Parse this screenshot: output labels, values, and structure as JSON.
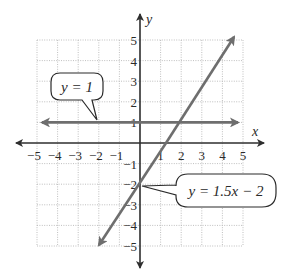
{
  "chart_data": {
    "type": "line",
    "title": "",
    "xlabel": "x",
    "ylabel": "y",
    "xlim": [
      -5,
      5
    ],
    "ylim": [
      -5,
      5
    ],
    "grid": true,
    "x_ticks": [
      -5,
      -4,
      -3,
      -2,
      -1,
      1,
      2,
      3,
      4,
      5
    ],
    "y_ticks": [
      -5,
      -4,
      -3,
      -2,
      -1,
      1,
      2,
      3,
      4,
      5
    ],
    "x_tick_labels": [
      "−5",
      "−4",
      "−3",
      "−2",
      "−1",
      "1",
      "2",
      "3",
      "4",
      "5"
    ],
    "y_tick_labels": [
      "−5",
      "−4",
      "−3",
      "−2",
      "−1",
      "1",
      "2",
      "3",
      "4",
      "5"
    ],
    "series": [
      {
        "name": "y = 1",
        "equation": "y = 1",
        "x": [
          -5,
          5
        ],
        "y": [
          1,
          1
        ],
        "color": "#6e6e6e",
        "arrows": "both"
      },
      {
        "name": "y = 1.5x − 2",
        "equation": "y = 1.5x - 2",
        "x": [
          -2,
          4.67
        ],
        "y": [
          -5,
          5
        ],
        "color": "#6e6e6e",
        "arrows": "both"
      }
    ],
    "annotations": [
      {
        "text": "y = 1",
        "points_to": [
          -2,
          1
        ]
      },
      {
        "text": "y = 1.5x − 2",
        "points_to": [
          0,
          -2
        ]
      }
    ]
  },
  "labels": {
    "x_axis": "x",
    "y_axis": "y",
    "callout_horizontal": "y = 1",
    "callout_slanted": "y = 1.5x − 2"
  }
}
